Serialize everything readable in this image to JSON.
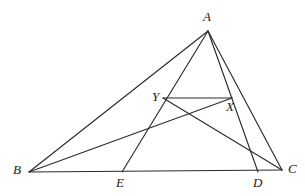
{
  "figure": {
    "stroke_color": "#2b2b2b",
    "background_color": "#ffffff",
    "label_color": "#1a1a1a",
    "width": 305,
    "height": 196
  },
  "points": {
    "A": {
      "label": "A",
      "x": 208,
      "y": 31,
      "label_x": 203,
      "label_y": 10
    },
    "B": {
      "label": "B",
      "x": 29,
      "y": 172,
      "label_x": 13,
      "label_y": 163
    },
    "C": {
      "label": "C",
      "x": 282,
      "y": 170,
      "label_x": 288,
      "label_y": 162
    },
    "D": {
      "label": "D",
      "x": 258,
      "y": 172,
      "label_x": 253,
      "label_y": 176
    },
    "E": {
      "label": "E",
      "x": 122,
      "y": 172,
      "label_x": 116,
      "label_y": 176
    },
    "X": {
      "label": "X",
      "x": 232,
      "y": 98,
      "label_x": 226,
      "label_y": 100
    },
    "Y": {
      "label": "Y",
      "x": 163,
      "y": 98,
      "label_x": 152,
      "label_y": 90
    }
  },
  "segments": [
    {
      "name": "side-AB",
      "from": "A",
      "to": "B"
    },
    {
      "name": "side-BC",
      "from": "B",
      "to": "C"
    },
    {
      "name": "side-AC",
      "from": "A",
      "to": "C"
    },
    {
      "name": "cevian-AE",
      "from": "A",
      "to": "E"
    },
    {
      "name": "cevian-AD",
      "from": "A",
      "to": "D"
    },
    {
      "name": "segment-YX",
      "from": "Y",
      "to": "X"
    },
    {
      "name": "segment-BX",
      "from": "B",
      "to": "X"
    },
    {
      "name": "segment-YC",
      "from": "Y",
      "to": "C"
    }
  ],
  "labels": [
    "A",
    "B",
    "C",
    "D",
    "E",
    "X",
    "Y"
  ]
}
